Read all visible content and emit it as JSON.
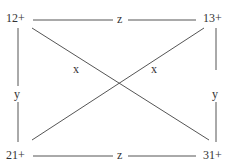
{
  "diagram": {
    "nodes": {
      "top_left": "12+",
      "top_right": "13+",
      "bottom_left": "21+",
      "bottom_right": "31+"
    },
    "edges": {
      "top": "z",
      "bottom": "z",
      "left": "y",
      "right": "y",
      "diagonal_main": "x",
      "diagonal_anti": "x"
    },
    "colors": {
      "line": "#555555",
      "text": "#333333",
      "background": "#ffffff"
    }
  }
}
